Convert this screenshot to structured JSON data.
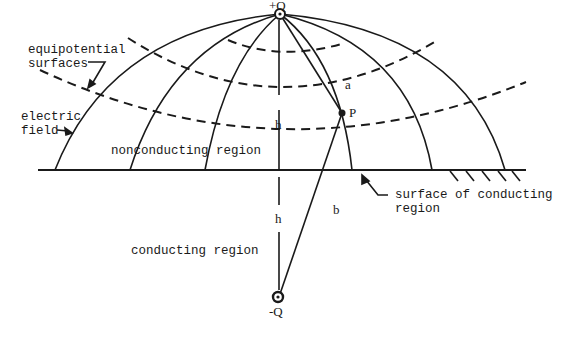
{
  "diagram": {
    "type": "physics-schematic",
    "labels": {
      "plus_charge": "+Q",
      "minus_charge": "-Q",
      "equipotential": "equipotential\nsurfaces",
      "electric_field": "electric\nfield",
      "nonconducting": "nonconducting region",
      "conducting": "conducting region",
      "surface": "surface of conducting\nregion",
      "h_upper": "h",
      "h_lower": "h",
      "a": "a",
      "b": "b",
      "p": "P"
    },
    "colors": {
      "ink": "#1a1a1a",
      "background": "#ffffff"
    }
  }
}
